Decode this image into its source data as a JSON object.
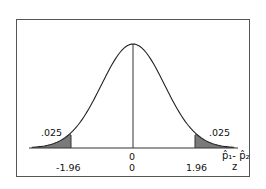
{
  "chart_data": {
    "type": "area",
    "title": "",
    "xlabel_top": "p̂₁ - p̂₂",
    "xlabel_bottom": "z",
    "ylabel": "",
    "tick_labels_top_row": [
      "0"
    ],
    "tick_labels_bottom_row": [
      "-1.96",
      "0",
      "1.96"
    ],
    "critical_values": [
      -1.96,
      1.96
    ],
    "center": 0,
    "tail_areas": {
      "left": 0.025,
      "right": 0.025
    },
    "annotations": [
      ".025",
      ".025"
    ],
    "grid": false,
    "legend": null,
    "xlim": [
      -3.2,
      3.2
    ],
    "curve_color": "#222222",
    "shade_color": "#777777"
  },
  "labels": {
    "left_tail": ".025",
    "right_tail": ".025",
    "top_zero": "0",
    "z_left": "-1.96",
    "z_center": "0",
    "z_right": "1.96",
    "axis_p_label": "p̂₁- p̂₂",
    "axis_z_label": "z"
  }
}
